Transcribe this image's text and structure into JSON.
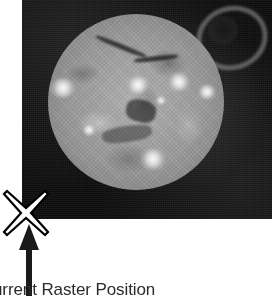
{
  "figure": {
    "name": "solar-raster-position-figure",
    "caption": "urrent Raster Position",
    "background_color": "#ffffff"
  },
  "solar_image": {
    "name": "solar-euv-image",
    "description": "Grayscale extreme-ultraviolet image of the solar disk",
    "panel_background_color": "#0d0d0d",
    "disk_color": "#a8a8a8",
    "bright_region_color": "#ffffff",
    "dark_filament_color": "#141414",
    "features": [
      "solar-disk",
      "bright-active-regions",
      "dark-filament-channel",
      "coronal-loop-top-right"
    ]
  },
  "marker": {
    "name": "current-raster-position-marker",
    "glyph": "x-cross",
    "fill_color": "#ffffff",
    "outline_color": "#000000"
  },
  "arrow": {
    "name": "caption-pointer-arrow",
    "direction": "up",
    "color": "#1a1a1a"
  }
}
